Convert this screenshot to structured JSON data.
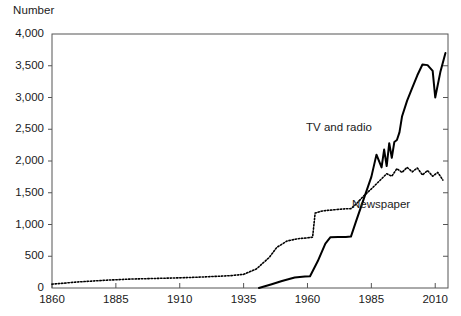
{
  "chart_data": {
    "type": "line",
    "title": "",
    "ylabel": "Number",
    "xlabel": "",
    "xlim": [
      1860,
      2015
    ],
    "ylim": [
      0,
      4000
    ],
    "grid": false,
    "legend_position": "inline-annotations",
    "xticks": [
      "1860",
      "1885",
      "1910",
      "1935",
      "1960",
      "1985",
      "2010"
    ],
    "xtick_values": [
      1860,
      1885,
      1910,
      1935,
      1960,
      1985,
      2010
    ],
    "yticks": [
      "0",
      "500",
      "1,000",
      "1,500",
      "2,000",
      "2,500",
      "3,000",
      "3,500",
      "4,000"
    ],
    "ytick_values": [
      0,
      500,
      1000,
      1500,
      2000,
      2500,
      3000,
      3500,
      4000
    ],
    "series": [
      {
        "name": "TV and radio",
        "style": "solid",
        "color": "#000000",
        "annotation": "TV and radio",
        "x": [
          1941,
          1946,
          1950,
          1955,
          1959,
          1961,
          1964,
          1967,
          1969,
          1972,
          1975,
          1977,
          1979,
          1982,
          1985,
          1987,
          1989,
          1990,
          1991,
          1992,
          1993,
          1994,
          1995,
          1996,
          1997,
          1999,
          2001,
          2003,
          2005,
          2007,
          2009,
          2010,
          2012,
          2014
        ],
        "values": [
          0,
          60,
          110,
          165,
          180,
          185,
          420,
          700,
          800,
          805,
          805,
          810,
          1050,
          1400,
          1750,
          2100,
          1900,
          2180,
          1920,
          2280,
          2050,
          2300,
          2330,
          2450,
          2700,
          2950,
          3150,
          3350,
          3520,
          3510,
          3420,
          3000,
          3400,
          3700
        ]
      },
      {
        "name": "Newspaper",
        "style": "dotted",
        "color": "#000000",
        "annotation": "Newspaper",
        "x": [
          1860,
          1870,
          1880,
          1890,
          1900,
          1910,
          1920,
          1930,
          1935,
          1940,
          1945,
          1948,
          1952,
          1956,
          1960,
          1962,
          1963,
          1966,
          1970,
          1974,
          1977,
          1979,
          1982,
          1985,
          1987,
          1989,
          1991,
          1993,
          1995,
          1997,
          1999,
          2001,
          2003,
          2005,
          2007,
          2009,
          2011,
          2013
        ],
        "values": [
          60,
          95,
          120,
          140,
          150,
          160,
          175,
          195,
          215,
          300,
          480,
          640,
          740,
          775,
          790,
          800,
          1180,
          1215,
          1230,
          1245,
          1250,
          1320,
          1450,
          1560,
          1640,
          1720,
          1800,
          1760,
          1880,
          1820,
          1900,
          1830,
          1890,
          1780,
          1850,
          1760,
          1820,
          1700
        ]
      }
    ]
  },
  "axes": {
    "y_axis_title": "Number"
  }
}
